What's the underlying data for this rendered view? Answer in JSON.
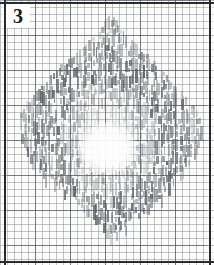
{
  "figure": {
    "label": "3",
    "caption_visible": false,
    "medium": "pencil-hatching-on-graph-paper",
    "paper": {
      "grid_pitch_px": 7,
      "major_grid_every_cells": 5,
      "grid_color": "#6e7680",
      "major_grid_color": "#464e58",
      "background_color": "#fbfbfa",
      "border_color": "#2b2b2b"
    },
    "ink": {
      "color": "#555a60",
      "stroke_orientation": "vertical",
      "stroke_width_px": 2,
      "bounds": {
        "x_min": 18,
        "x_max": 201,
        "y_min": 18,
        "y_max": 237
      },
      "center": {
        "x": 107,
        "y": 140
      },
      "hollow_center": true
    },
    "shape_outline": [
      {
        "y": 20,
        "x_left": 104,
        "x_right": 114
      },
      {
        "y": 32,
        "x_left": 96,
        "x_right": 124
      },
      {
        "y": 44,
        "x_left": 86,
        "x_right": 134
      },
      {
        "y": 56,
        "x_left": 72,
        "x_right": 146
      },
      {
        "y": 68,
        "x_left": 58,
        "x_right": 158
      },
      {
        "y": 80,
        "x_left": 46,
        "x_right": 170
      },
      {
        "y": 92,
        "x_left": 34,
        "x_right": 182
      },
      {
        "y": 104,
        "x_left": 24,
        "x_right": 192
      },
      {
        "y": 116,
        "x_left": 19,
        "x_right": 199
      },
      {
        "y": 128,
        "x_left": 18,
        "x_right": 201
      },
      {
        "y": 140,
        "x_left": 20,
        "x_right": 200
      },
      {
        "y": 152,
        "x_left": 26,
        "x_right": 196
      },
      {
        "y": 164,
        "x_left": 34,
        "x_right": 189
      },
      {
        "y": 176,
        "x_left": 46,
        "x_right": 180
      },
      {
        "y": 188,
        "x_left": 60,
        "x_right": 168
      },
      {
        "y": 200,
        "x_left": 74,
        "x_right": 156
      },
      {
        "y": 212,
        "x_left": 88,
        "x_right": 142
      },
      {
        "y": 224,
        "x_left": 98,
        "x_right": 128
      },
      {
        "y": 234,
        "x_left": 104,
        "x_right": 116
      }
    ]
  }
}
